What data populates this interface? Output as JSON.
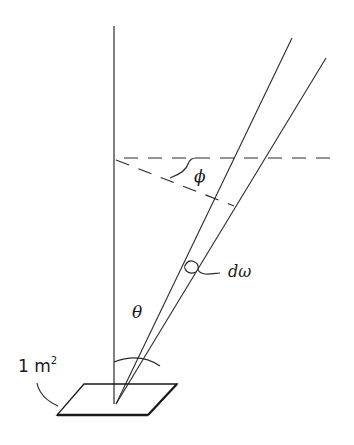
{
  "diagram": {
    "labels": {
      "phi": "ϕ",
      "theta": "θ",
      "d_omega": "dω",
      "area_number": "1 m",
      "area_exponent": "2"
    },
    "colors": {
      "line": "#2a2a2a",
      "background": "#ffffff"
    },
    "elements": [
      {
        "name": "zenith-vertical-line",
        "from": [
          114,
          26
        ],
        "to": [
          114,
          404
        ]
      },
      {
        "name": "cone-edge-left",
        "from": [
          116,
          404
        ],
        "to": [
          292,
          38
        ]
      },
      {
        "name": "cone-edge-right",
        "from": [
          116,
          404
        ],
        "to": [
          326,
          58
        ]
      },
      {
        "name": "horizontal-dashed-reference",
        "from": [
          124,
          158
        ],
        "to": [
          332,
          158
        ]
      },
      {
        "name": "azimuth-dashed-projection",
        "from": [
          116,
          160
        ],
        "to": [
          232,
          206
        ]
      },
      {
        "name": "surface-patch",
        "points": [
          [
            84,
            384
          ],
          [
            177,
            384
          ],
          [
            148,
            415
          ],
          [
            57,
            415
          ]
        ]
      }
    ]
  }
}
